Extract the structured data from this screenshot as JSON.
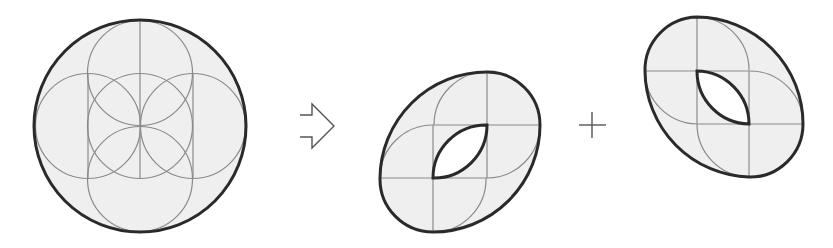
{
  "diagram": {
    "colors": {
      "background": "#ffffff",
      "fill": "#efefef",
      "outline": "#2a2a2a",
      "construction_lines": "#8a8a8a",
      "symbols": "#555555"
    },
    "panels": [
      {
        "id": "source",
        "label": "circle-of-circles",
        "shape": "large circle with inscribed overlapping small circles"
      },
      {
        "id": "operator-arrow",
        "label": "outlined right arrow",
        "icon": "arrow-right-outline-icon"
      },
      {
        "id": "result-a",
        "label": "oval tilted right with lens hole"
      },
      {
        "id": "operator-plus",
        "label": "plus sign",
        "icon": "plus-icon"
      },
      {
        "id": "result-b",
        "label": "oval tilted left with lens hole"
      }
    ]
  }
}
